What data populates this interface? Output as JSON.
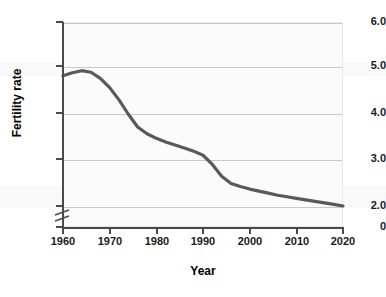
{
  "chart_data": {
    "type": "line",
    "title": "",
    "xlabel": "Year",
    "ylabel": "Fertility rate",
    "xlim": [
      1960,
      2020
    ],
    "ylim": [
      2.0,
      6.0
    ],
    "y_axis_broken": true,
    "y_break_from": 0,
    "y_break_to": 2.0,
    "grid": "horizontal",
    "legend": "none",
    "line_color": "#595959",
    "x_ticks": [
      "1960",
      "1970",
      "1980",
      "1990",
      "2000",
      "2010",
      "2020"
    ],
    "y_ticks": [
      "0",
      "2.0",
      "3.0",
      "4.0",
      "5.0",
      "6.0"
    ],
    "series": [
      {
        "name": "Fertility rate",
        "x": [
          1960,
          1962,
          1964,
          1966,
          1968,
          1970,
          1972,
          1974,
          1976,
          1978,
          1980,
          1982,
          1984,
          1986,
          1988,
          1990,
          1992,
          1994,
          1996,
          1998,
          2000,
          2002,
          2004,
          2006,
          2008,
          2010,
          2012,
          2014,
          2016,
          2018,
          2020
        ],
        "values": [
          4.95,
          5.01,
          5.05,
          5.02,
          4.9,
          4.72,
          4.48,
          4.2,
          3.95,
          3.82,
          3.73,
          3.66,
          3.6,
          3.54,
          3.48,
          3.4,
          3.22,
          2.99,
          2.85,
          2.79,
          2.74,
          2.7,
          2.66,
          2.62,
          2.59,
          2.56,
          2.53,
          2.5,
          2.47,
          2.44,
          2.41
        ]
      }
    ]
  },
  "axes": {
    "y_ticks": [
      {
        "label": "6.0",
        "value": 6.0
      },
      {
        "label": "5.0",
        "value": 5.0
      },
      {
        "label": "4.0",
        "value": 4.0
      },
      {
        "label": "3.0",
        "value": 3.0
      },
      {
        "label": "2.0",
        "value": 2.0
      },
      {
        "label": "0",
        "value": 0
      }
    ],
    "x_ticks": [
      {
        "label": "1960",
        "value": 1960
      },
      {
        "label": "1970",
        "value": 1970
      },
      {
        "label": "1980",
        "value": 1980
      },
      {
        "label": "1990",
        "value": 1990
      },
      {
        "label": "2000",
        "value": 2000
      },
      {
        "label": "2010",
        "value": 2010
      },
      {
        "label": "2020",
        "value": 2020
      }
    ]
  },
  "labels": {
    "y_axis_title": "Fertility rate",
    "x_axis_title": "Year"
  },
  "watermark": {
    "text": "and the sub"
  }
}
